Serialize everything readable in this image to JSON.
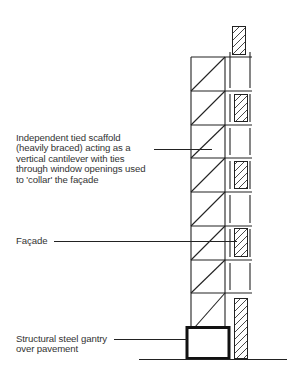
{
  "diagram": {
    "type": "scaffold-section",
    "labels": {
      "scaffold": "Independent tied scaffold\n(heavily braced) acting as a\nvertical cantilever with ties\nthrough window openings used\nto 'collar' the façade",
      "facade": "Façade",
      "gantry": "Structural steel gantry\nover pavement"
    },
    "colors": {
      "line": "#222222",
      "text": "#333333",
      "background": "#ffffff"
    },
    "scaffold_bays": 8,
    "window_openings": 5
  }
}
